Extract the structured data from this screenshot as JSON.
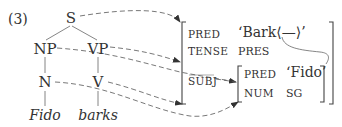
{
  "example_number": "(3)",
  "c_structure": {
    "nodes": {
      "S": "S",
      "NP": "NP",
      "VP": "VP",
      "N": "N",
      "V": "V"
    },
    "words": {
      "fido": "Fido",
      "barks": "barks"
    },
    "edges": [
      [
        "S",
        "NP"
      ],
      [
        "S",
        "VP"
      ],
      [
        "NP",
        "N"
      ],
      [
        "VP",
        "V"
      ],
      [
        "N",
        "Fido"
      ],
      [
        "V",
        "barks"
      ]
    ]
  },
  "f_structure": {
    "outer": {
      "rows": [
        {
          "attr": "PRED",
          "value": "‘Bark⟨—⟩’"
        },
        {
          "attr": "TENSE",
          "value": "PRES"
        },
        {
          "attr": "SUBJ",
          "value": "[f-structure]"
        }
      ]
    },
    "subj": {
      "rows": [
        {
          "attr": "PRED",
          "value": "‘Fido’"
        },
        {
          "attr": "NUM",
          "value": "SG"
        }
      ]
    }
  },
  "mappings": [
    {
      "from": "S",
      "to": "outer f-structure"
    },
    {
      "from": "VP",
      "to": "outer f-structure"
    },
    {
      "from": "V",
      "to": "outer f-structure"
    },
    {
      "from": "NP",
      "to": "SUBJ f-structure"
    },
    {
      "from": "N",
      "to": "SUBJ f-structure"
    },
    {
      "from": "SUBJ",
      "to": "SUBJ f-structure"
    }
  ],
  "colors": {
    "ink": "#333333",
    "dashed": "#555555"
  }
}
